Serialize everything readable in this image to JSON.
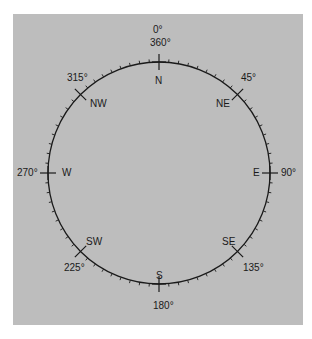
{
  "diagram": {
    "type": "compass-rose",
    "background_color": "#bdbdbd",
    "line_color": "#1a1a1a",
    "tick_interval_degrees": 5,
    "directions": [
      {
        "abbr": "N",
        "degrees": [
          "0°",
          "360°"
        ]
      },
      {
        "abbr": "NE",
        "degrees": [
          "45°"
        ]
      },
      {
        "abbr": "E",
        "degrees": [
          "90°"
        ]
      },
      {
        "abbr": "SE",
        "degrees": [
          "135°"
        ]
      },
      {
        "abbr": "S",
        "degrees": [
          "180°"
        ]
      },
      {
        "abbr": "SW",
        "degrees": [
          "225°"
        ]
      },
      {
        "abbr": "W",
        "degrees": [
          "270°"
        ]
      },
      {
        "abbr": "NW",
        "degrees": [
          "315°"
        ]
      }
    ]
  }
}
